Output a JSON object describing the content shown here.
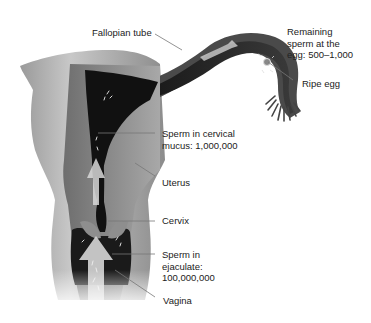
{
  "diagram": {
    "labels": {
      "fallopian_tube": "Fallopian tube",
      "remaining_sperm_line1": "Remaining",
      "remaining_sperm_line2": "sperm at the",
      "remaining_sperm_line3": "egg: 500–1,000",
      "ripe_egg": "Ripe egg",
      "cervical_line1": "Sperm in cervical",
      "cervical_line2": "mucus: 1,000,000",
      "uterus": "Uterus",
      "cervix": "Cervix",
      "ejaculate_line1": "Sperm in",
      "ejaculate_line2": "ejaculate:",
      "ejaculate_line3": "100,000,000",
      "vagina": "Vagina"
    },
    "colors": {
      "background": "#ffffff",
      "tissue_light": "#bdbdbd",
      "tissue_mid": "#8a8a8a",
      "tissue_dark": "#555555",
      "cavity": "#111111",
      "leader_line": "#777777",
      "text": "#222222"
    }
  }
}
